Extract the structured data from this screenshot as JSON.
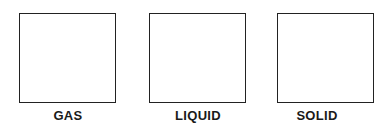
{
  "states": [
    {
      "label": "GAS"
    },
    {
      "label": "LIQUID"
    },
    {
      "label": "SOLID"
    }
  ]
}
